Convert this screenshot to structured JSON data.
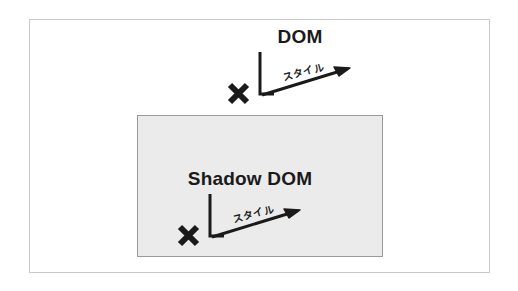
{
  "figure": {
    "name": "dom-vs-shadow-dom-style-encapsulation-diagram",
    "background_color": "#ffffff",
    "outer_frame_color": "#c9c9c9",
    "ink_color": "#1a1a1a"
  },
  "shadow_dom_panel": {
    "fill_color": "#ebebeb",
    "border_color": "#9a9a9a"
  },
  "groups": [
    {
      "title": "DOM",
      "style_label": "スタイル",
      "blocked_mark": "✖"
    },
    {
      "title": "Shadow DOM",
      "style_label": "スタイル",
      "blocked_mark": "✖"
    }
  ]
}
